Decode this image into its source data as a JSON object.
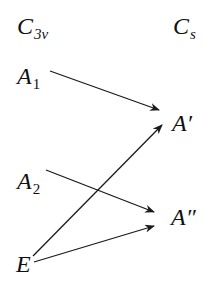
{
  "header": {
    "left": {
      "base": "C",
      "sub": "3v"
    },
    "right": {
      "base": "C",
      "sub": "s"
    }
  },
  "left_column": [
    {
      "id": "A1",
      "base": "A",
      "sub": "1"
    },
    {
      "id": "A2",
      "base": "A",
      "sub": "2"
    },
    {
      "id": "E",
      "base": "E",
      "sub": ""
    }
  ],
  "right_column": [
    {
      "id": "A1p",
      "text": "A′"
    },
    {
      "id": "A2p",
      "text": "A″"
    }
  ],
  "correlations": [
    {
      "from": "A1",
      "to": "A′"
    },
    {
      "from": "A2",
      "to": "A″"
    },
    {
      "from": "E",
      "to": "A′"
    },
    {
      "from": "E",
      "to": "A″"
    }
  ],
  "colors": {
    "line": "#1a1a1a",
    "text": "#111111",
    "background": "#ffffff"
  }
}
